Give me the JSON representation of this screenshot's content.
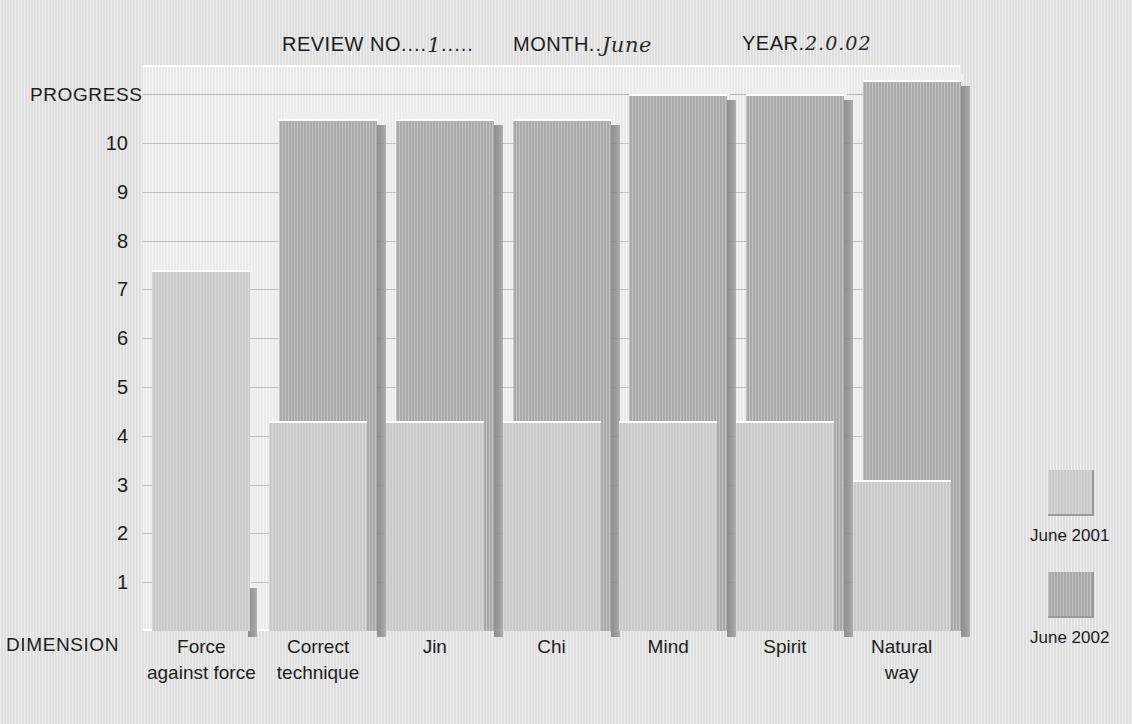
{
  "header": {
    "review_label": "REVIEW NO",
    "review_dots_left": "....",
    "review_value": "1",
    "review_dots_right": ".....",
    "month_label": "MONTH",
    "month_dots": "..",
    "month_value": "June",
    "year_label": "YEAR",
    "year_dot": ".",
    "year_value": "2.0.02"
  },
  "axes": {
    "y_title": "PROGRESS",
    "x_title": "DIMENSION",
    "y_ticks": [
      "10",
      "9",
      "8",
      "7",
      "6",
      "5",
      "4",
      "3",
      "2",
      "1"
    ],
    "y_min": 0,
    "y_max": 11.6
  },
  "legend": {
    "entries": [
      {
        "label": "June 2001",
        "color": "#c9c9c9"
      },
      {
        "label": "June 2002",
        "color": "#a9a9a9"
      }
    ]
  },
  "colors": {
    "page_background": "#dedede",
    "plot_background": "#eaeaea",
    "series_2001": "#c9c9c9",
    "series_2002": "#a9a9a9",
    "text": "#1d1d1d",
    "gridline": "#b9b9b9"
  },
  "chart_data": {
    "type": "bar",
    "title": "",
    "xlabel": "DIMENSION",
    "ylabel": "PROGRESS",
    "ylim": [
      0,
      11.6
    ],
    "grid": true,
    "legend_position": "right",
    "categories": [
      "Force against force",
      "Correct technique",
      "Jin",
      "Chi",
      "Mind",
      "Spirit",
      "Natural way"
    ],
    "category_lines": [
      [
        "Force",
        "against force"
      ],
      [
        "Correct",
        "technique"
      ],
      [
        "Jin"
      ],
      [
        "Chi"
      ],
      [
        "Mind"
      ],
      [
        "Spirit"
      ],
      [
        "Natural",
        "way"
      ]
    ],
    "series": [
      {
        "name": "June 2001",
        "color": "#c9c9c9",
        "values": [
          7.4,
          4.3,
          4.3,
          4.3,
          4.3,
          4.3,
          3.1
        ]
      },
      {
        "name": "June 2002",
        "color": "#a9a9a9",
        "values": [
          1.0,
          10.5,
          10.5,
          10.5,
          11.0,
          11.0,
          11.3
        ]
      }
    ]
  }
}
